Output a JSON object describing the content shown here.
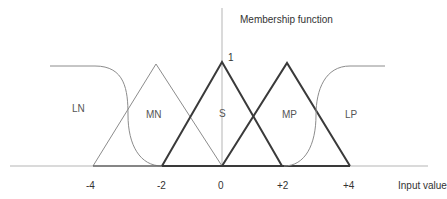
{
  "title": "Membership function",
  "y_max_label": "1",
  "x_axis_label": "Input value",
  "ticks": [
    {
      "label": "-4",
      "x": 93
    },
    {
      "label": "-2",
      "x": 162
    },
    {
      "label": "0",
      "x": 222
    },
    {
      "label": "+2",
      "x": 284
    },
    {
      "label": "+4",
      "x": 350
    }
  ],
  "sets": [
    {
      "name": "LN",
      "shape": "z-shaped",
      "range": [
        -4,
        -2
      ],
      "style": "thin"
    },
    {
      "name": "MN",
      "shape": "triangle",
      "points": [
        -4,
        -2.2,
        0
      ],
      "style": "thin"
    },
    {
      "name": "S",
      "shape": "triangle",
      "points": [
        -2,
        0,
        2
      ],
      "style": "thick"
    },
    {
      "name": "MP",
      "shape": "triangle",
      "points": [
        0,
        2.2,
        4
      ],
      "style": "thick"
    },
    {
      "name": "LP",
      "shape": "s-shaped",
      "range": [
        2,
        4
      ],
      "style": "thin"
    }
  ],
  "colors": {
    "thin_line": "#8c8c8c",
    "thick_line": "#3a3a3a",
    "axis": "#b0b0b0",
    "text": "#333333"
  }
}
